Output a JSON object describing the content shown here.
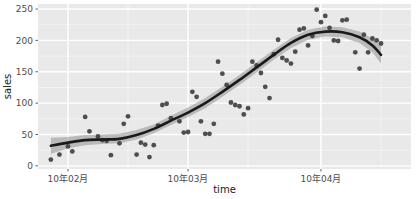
{
  "chart_data": {
    "type": "scatter",
    "title": "",
    "subtitle": "",
    "xlabel": "time",
    "ylabel": "sales",
    "grid": true,
    "legend": null,
    "legend_position": "none",
    "panel_background": "#e9e9e9",
    "major_grid_color": "#ffffff",
    "minor_grid_color": "#f4f4f4",
    "point_color": "#404040",
    "smooth_line_color": "#1a1a1a",
    "smooth_band_color": "#9c9c9c",
    "smooth_method": "loess",
    "x_axis": {
      "type": "date",
      "tick_labels": [
        "10年02月",
        "10年03月",
        "10年04月"
      ],
      "tick_values": [
        "2010-02-01",
        "2010-03-01",
        "2010-04-01"
      ],
      "xlim": [
        "2010-01-25",
        "2010-04-22"
      ]
    },
    "y_axis": {
      "tick_labels": [
        "0",
        "50",
        "100",
        "150",
        "200",
        "250"
      ],
      "tick_values": [
        0,
        50,
        100,
        150,
        200,
        250
      ],
      "ylim": [
        -5,
        258
      ]
    },
    "points": [
      {
        "x": "2010-01-28",
        "y": 10
      },
      {
        "x": "2010-01-30",
        "y": 18
      },
      {
        "x": "2010-02-01",
        "y": 31
      },
      {
        "x": "2010-02-02",
        "y": 23
      },
      {
        "x": "2010-02-05",
        "y": 78
      },
      {
        "x": "2010-02-06",
        "y": 55
      },
      {
        "x": "2010-02-08",
        "y": 47
      },
      {
        "x": "2010-02-09",
        "y": 41
      },
      {
        "x": "2010-02-10",
        "y": 40
      },
      {
        "x": "2010-02-11",
        "y": 17
      },
      {
        "x": "2010-02-13",
        "y": 36
      },
      {
        "x": "2010-02-14",
        "y": 67
      },
      {
        "x": "2010-02-15",
        "y": 79
      },
      {
        "x": "2010-02-17",
        "y": 18
      },
      {
        "x": "2010-02-18",
        "y": 37
      },
      {
        "x": "2010-02-19",
        "y": 34
      },
      {
        "x": "2010-02-20",
        "y": 14
      },
      {
        "x": "2010-02-21",
        "y": 33
      },
      {
        "x": "2010-02-22",
        "y": 64
      },
      {
        "x": "2010-02-23",
        "y": 97
      },
      {
        "x": "2010-02-24",
        "y": 99
      },
      {
        "x": "2010-02-25",
        "y": 76
      },
      {
        "x": "2010-02-27",
        "y": 71
      },
      {
        "x": "2010-02-28",
        "y": 53
      },
      {
        "x": "2010-03-01",
        "y": 54
      },
      {
        "x": "2010-03-02",
        "y": 118
      },
      {
        "x": "2010-03-03",
        "y": 110
      },
      {
        "x": "2010-03-04",
        "y": 71
      },
      {
        "x": "2010-03-05",
        "y": 51
      },
      {
        "x": "2010-03-06",
        "y": 51
      },
      {
        "x": "2010-03-07",
        "y": 67
      },
      {
        "x": "2010-03-08",
        "y": 166
      },
      {
        "x": "2010-03-09",
        "y": 147
      },
      {
        "x": "2010-03-10",
        "y": 129
      },
      {
        "x": "2010-03-11",
        "y": 101
      },
      {
        "x": "2010-03-12",
        "y": 97
      },
      {
        "x": "2010-03-13",
        "y": 95
      },
      {
        "x": "2010-03-14",
        "y": 82
      },
      {
        "x": "2010-03-15",
        "y": 92
      },
      {
        "x": "2010-03-16",
        "y": 166
      },
      {
        "x": "2010-03-17",
        "y": 160
      },
      {
        "x": "2010-03-18",
        "y": 148
      },
      {
        "x": "2010-03-19",
        "y": 126
      },
      {
        "x": "2010-03-20",
        "y": 108
      },
      {
        "x": "2010-03-21",
        "y": 178
      },
      {
        "x": "2010-03-22",
        "y": 201
      },
      {
        "x": "2010-03-23",
        "y": 172
      },
      {
        "x": "2010-03-24",
        "y": 168
      },
      {
        "x": "2010-03-25",
        "y": 163
      },
      {
        "x": "2010-03-26",
        "y": 182
      },
      {
        "x": "2010-03-27",
        "y": 217
      },
      {
        "x": "2010-03-28",
        "y": 219
      },
      {
        "x": "2010-03-29",
        "y": 192
      },
      {
        "x": "2010-03-30",
        "y": 207
      },
      {
        "x": "2010-03-31",
        "y": 249
      },
      {
        "x": "2010-04-01",
        "y": 229
      },
      {
        "x": "2010-04-02",
        "y": 239
      },
      {
        "x": "2010-04-03",
        "y": 220
      },
      {
        "x": "2010-04-04",
        "y": 200
      },
      {
        "x": "2010-04-05",
        "y": 199
      },
      {
        "x": "2010-04-06",
        "y": 232
      },
      {
        "x": "2010-04-07",
        "y": 233
      },
      {
        "x": "2010-04-09",
        "y": 181
      },
      {
        "x": "2010-04-10",
        "y": 155
      },
      {
        "x": "2010-04-11",
        "y": 209
      },
      {
        "x": "2010-04-12",
        "y": 181
      },
      {
        "x": "2010-04-13",
        "y": 203
      },
      {
        "x": "2010-04-14",
        "y": 200
      },
      {
        "x": "2010-04-15",
        "y": 195
      }
    ],
    "smooth_line": [
      {
        "x": "2010-01-28",
        "y": 32
      },
      {
        "x": "2010-02-01",
        "y": 37
      },
      {
        "x": "2010-02-05",
        "y": 41
      },
      {
        "x": "2010-02-09",
        "y": 42
      },
      {
        "x": "2010-02-13",
        "y": 43
      },
      {
        "x": "2010-02-17",
        "y": 49
      },
      {
        "x": "2010-02-21",
        "y": 59
      },
      {
        "x": "2010-02-25",
        "y": 72
      },
      {
        "x": "2010-03-01",
        "y": 85
      },
      {
        "x": "2010-03-05",
        "y": 100
      },
      {
        "x": "2010-03-09",
        "y": 118
      },
      {
        "x": "2010-03-13",
        "y": 137
      },
      {
        "x": "2010-03-17",
        "y": 157
      },
      {
        "x": "2010-03-21",
        "y": 177
      },
      {
        "x": "2010-03-25",
        "y": 196
      },
      {
        "x": "2010-03-29",
        "y": 209
      },
      {
        "x": "2010-04-02",
        "y": 214
      },
      {
        "x": "2010-04-06",
        "y": 213
      },
      {
        "x": "2010-04-10",
        "y": 205
      },
      {
        "x": "2010-04-13",
        "y": 192
      },
      {
        "x": "2010-04-15",
        "y": 177
      }
    ],
    "smooth_band": [
      {
        "x": "2010-01-28",
        "ymin": 19,
        "ymax": 45
      },
      {
        "x": "2010-02-01",
        "ymin": 28,
        "ymax": 46
      },
      {
        "x": "2010-02-05",
        "ymin": 33,
        "ymax": 49
      },
      {
        "x": "2010-02-09",
        "ymin": 35,
        "ymax": 50
      },
      {
        "x": "2010-02-13",
        "ymin": 36,
        "ymax": 51
      },
      {
        "x": "2010-02-17",
        "ymin": 42,
        "ymax": 57
      },
      {
        "x": "2010-02-21",
        "ymin": 52,
        "ymax": 66
      },
      {
        "x": "2010-02-25",
        "ymin": 65,
        "ymax": 80
      },
      {
        "x": "2010-03-01",
        "ymin": 78,
        "ymax": 93
      },
      {
        "x": "2010-03-05",
        "ymin": 92,
        "ymax": 108
      },
      {
        "x": "2010-03-09",
        "ymin": 110,
        "ymax": 126
      },
      {
        "x": "2010-03-13",
        "ymin": 129,
        "ymax": 145
      },
      {
        "x": "2010-03-17",
        "ymin": 149,
        "ymax": 165
      },
      {
        "x": "2010-03-21",
        "ymin": 169,
        "ymax": 185
      },
      {
        "x": "2010-03-25",
        "ymin": 188,
        "ymax": 204
      },
      {
        "x": "2010-03-29",
        "ymin": 201,
        "ymax": 217
      },
      {
        "x": "2010-04-02",
        "ymin": 206,
        "ymax": 222
      },
      {
        "x": "2010-04-06",
        "ymin": 205,
        "ymax": 221
      },
      {
        "x": "2010-04-10",
        "ymin": 196,
        "ymax": 214
      },
      {
        "x": "2010-04-13",
        "ymin": 181,
        "ymax": 203
      },
      {
        "x": "2010-04-15",
        "ymin": 163,
        "ymax": 191
      }
    ]
  }
}
